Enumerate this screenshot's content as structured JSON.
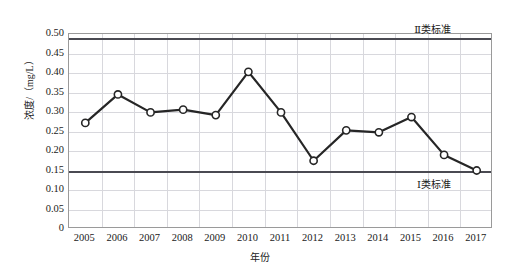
{
  "chart_data": {
    "type": "line",
    "title": "",
    "xlabel": "年份",
    "ylabel": "浓度/（mg/L）",
    "categories": [
      "2005",
      "2006",
      "2007",
      "2008",
      "2009",
      "2010",
      "2011",
      "2012",
      "2013",
      "2014",
      "2015",
      "2016",
      "2017"
    ],
    "values": [
      0.272,
      0.345,
      0.299,
      0.306,
      0.292,
      0.403,
      0.299,
      0.175,
      0.253,
      0.248,
      0.287,
      0.19,
      0.15
    ],
    "series": [
      {
        "name": "浓度",
        "values": [
          0.272,
          0.345,
          0.299,
          0.306,
          0.292,
          0.403,
          0.299,
          0.175,
          0.253,
          0.248,
          0.287,
          0.19,
          0.15
        ]
      }
    ],
    "ylim": [
      0,
      0.5
    ],
    "xlim_categories": 13,
    "ytick_labels": [
      "0.50",
      "0.45",
      "0.40",
      "0.35",
      "0.30",
      "0.25",
      "0.20",
      "0.15",
      "0.10",
      "0.05",
      "0"
    ],
    "ytick_values": [
      0.5,
      0.45,
      0.4,
      0.35,
      0.3,
      0.25,
      0.2,
      0.15,
      0.1,
      0.05,
      0
    ],
    "grid": true,
    "legend": "none",
    "marker": "open-circle",
    "line_color": "#262626",
    "marker_fill": "#ffffff",
    "grid_color": "#d8d8dd",
    "axis_color": "#9a9a9a",
    "reference_lines": [
      {
        "name": "class-2-standard",
        "label": "Ⅱ类标准",
        "value": 0.49,
        "color": "#4a4a52",
        "label_position": "top-right"
      },
      {
        "name": "class-1-standard",
        "label": "Ⅰ类标准",
        "value": 0.15,
        "color": "#4a4a52",
        "label_position": "bottom-right"
      }
    ],
    "annotations": []
  }
}
